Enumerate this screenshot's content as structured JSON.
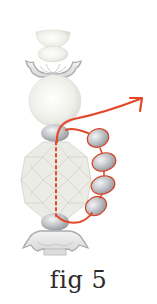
{
  "figure": {
    "caption": "fig 5",
    "colors": {
      "thread": "#e2492b",
      "pearl": "#f2f2ee",
      "gray_bead": "#b9bcc0",
      "cap_outline": "#a9abad",
      "crystal": "#e9e9e4"
    },
    "components": [
      {
        "name": "top-cup-bead"
      },
      {
        "name": "round-bead-small"
      },
      {
        "name": "top-bead-cap"
      },
      {
        "name": "large-pearl"
      },
      {
        "name": "gray-spacer-top"
      },
      {
        "name": "faceted-crystal"
      },
      {
        "name": "gray-spacer-bottom"
      },
      {
        "name": "bottom-bead-cap"
      }
    ],
    "side_beads_count": 4
  }
}
